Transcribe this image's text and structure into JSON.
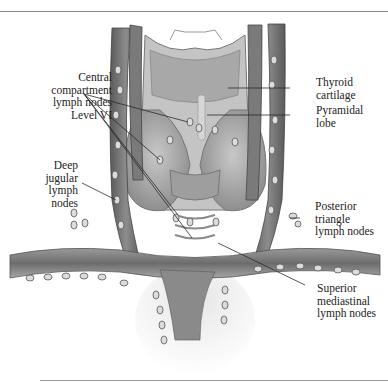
{
  "figure": {
    "labels": {
      "central_compartment": "Central\ncompartment\nlymph nodes\nLevel VI",
      "deep_jugular": "Deep\njugular\nlymph\nnodes",
      "thyroid_cartilage": "Thyroid\ncartilage",
      "pyramidal_lobe": "Pyramidal\nlobe",
      "posterior_triangle": "Posterior\ntriangle\nlymph nodes",
      "superior_mediastinal": "Superior\nmediastinal\nlymph nodes"
    },
    "colors": {
      "vessel": "#6e6e6e",
      "tissue": "#b4b4b4",
      "node": "#d8d8d8",
      "leader": "#2a2a2a",
      "text": "#222222"
    }
  }
}
